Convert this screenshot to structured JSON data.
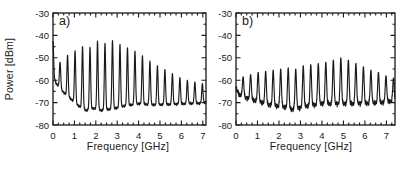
{
  "figure": {
    "background": "#ffffff",
    "line_color": "#1a1a1a",
    "panels": [
      {
        "label": "a)",
        "xlabel": "Frequency [GHz]",
        "ylabel": "Power [dBm]",
        "x_ticks": [
          "0",
          "1",
          "2",
          "3",
          "4",
          "5",
          "6",
          "7"
        ],
        "y_ticks": [
          "-30",
          "-40",
          "-50",
          "-60",
          "-70",
          "-80"
        ]
      },
      {
        "label": "b)",
        "xlabel": "Frequency [GHz]",
        "ylabel": "",
        "x_ticks": [
          "0",
          "1",
          "2",
          "3",
          "4",
          "5",
          "6",
          "7"
        ],
        "y_ticks": [
          "-30",
          "-40",
          "-50",
          "-60",
          "-70",
          "-80"
        ]
      }
    ]
  },
  "chart_data": [
    {
      "type": "line",
      "title": "a)",
      "xlabel": "Frequency [GHz]",
      "ylabel": "Power [dBm]",
      "xlim": [
        0,
        7.15
      ],
      "ylim": [
        -80,
        -30
      ],
      "x_major_tick": 1,
      "x_minor_tick": 0.25,
      "y_major_tick": 10,
      "y_minor_tick": 5,
      "comb_spacing_GHz": 0.35,
      "peak_sigma_GHz": 0.03,
      "noise_dB": 0.45,
      "peaks": [
        [
          0.0,
          -42.5
        ],
        [
          0.33,
          -52.0
        ],
        [
          0.68,
          -48.8
        ],
        [
          1.03,
          -46.8
        ],
        [
          1.38,
          -45.0
        ],
        [
          1.73,
          -45.3
        ],
        [
          2.08,
          -42.5
        ],
        [
          2.43,
          -43.5
        ],
        [
          2.78,
          -42.2
        ],
        [
          3.13,
          -44.0
        ],
        [
          3.48,
          -45.5
        ],
        [
          3.83,
          -47.0
        ],
        [
          4.18,
          -49.0
        ],
        [
          4.53,
          -51.5
        ],
        [
          4.88,
          -53.5
        ],
        [
          5.23,
          -55.2
        ],
        [
          5.58,
          -57.0
        ],
        [
          5.93,
          -58.8
        ],
        [
          6.28,
          -60.0
        ],
        [
          6.63,
          -60.8
        ],
        [
          6.98,
          -61.5
        ]
      ],
      "valleys": [
        [
          0.0,
          -58.0
        ],
        [
          0.15,
          -61.5
        ],
        [
          0.5,
          -65.5
        ],
        [
          0.85,
          -68.5
        ],
        [
          1.2,
          -71.5
        ],
        [
          1.55,
          -73.5
        ],
        [
          1.9,
          -72.5
        ],
        [
          2.25,
          -73.5
        ],
        [
          2.6,
          -73.0
        ],
        [
          2.95,
          -72.5
        ],
        [
          3.3,
          -71.5
        ],
        [
          3.65,
          -71.0
        ],
        [
          4.0,
          -70.5
        ],
        [
          4.7,
          -71.0
        ],
        [
          5.4,
          -70.8
        ],
        [
          6.1,
          -70.5
        ],
        [
          6.8,
          -70.3
        ],
        [
          7.15,
          -70.0
        ]
      ]
    },
    {
      "type": "line",
      "title": "b)",
      "xlabel": "Frequency [GHz]",
      "ylabel": "Power [dBm]",
      "xlim": [
        0,
        7.4
      ],
      "ylim": [
        -80,
        -30
      ],
      "x_major_tick": 1,
      "x_minor_tick": 0.25,
      "y_major_tick": 10,
      "y_minor_tick": 5,
      "comb_spacing_GHz": 0.35,
      "peak_sigma_GHz": 0.034,
      "noise_dB": 0.9,
      "peaks": [
        [
          0.33,
          -58.5
        ],
        [
          0.68,
          -57.5
        ],
        [
          1.03,
          -56.5
        ],
        [
          1.38,
          -56.0
        ],
        [
          1.73,
          -55.5
        ],
        [
          2.08,
          -55.0
        ],
        [
          2.43,
          -54.5
        ],
        [
          2.78,
          -55.0
        ],
        [
          3.13,
          -53.5
        ],
        [
          3.48,
          -53.0
        ],
        [
          3.83,
          -52.5
        ],
        [
          4.18,
          -52.0
        ],
        [
          4.53,
          -51.0
        ],
        [
          4.88,
          -50.0
        ],
        [
          5.23,
          -51.0
        ],
        [
          5.58,
          -52.5
        ],
        [
          5.93,
          -54.0
        ],
        [
          6.28,
          -55.5
        ],
        [
          6.63,
          -56.5
        ],
        [
          6.98,
          -58.0
        ],
        [
          7.33,
          -59.0
        ]
      ],
      "valleys": [
        [
          0.0,
          -63.5
        ],
        [
          0.15,
          -66.5
        ],
        [
          0.5,
          -68.0
        ],
        [
          0.85,
          -69.0
        ],
        [
          1.2,
          -70.0
        ],
        [
          1.55,
          -71.0
        ],
        [
          1.9,
          -71.5
        ],
        [
          2.25,
          -72.0
        ],
        [
          2.6,
          -73.0
        ],
        [
          2.95,
          -72.5
        ],
        [
          3.3,
          -71.5
        ],
        [
          3.65,
          -71.0
        ],
        [
          4.0,
          -70.5
        ],
        [
          4.7,
          -70.5
        ],
        [
          5.4,
          -70.5
        ],
        [
          6.1,
          -70.3
        ],
        [
          6.8,
          -70.0
        ],
        [
          7.4,
          -69.0
        ]
      ]
    }
  ]
}
